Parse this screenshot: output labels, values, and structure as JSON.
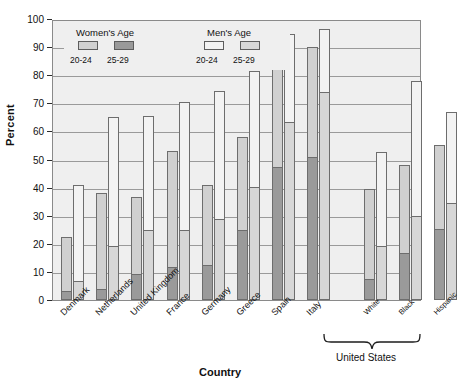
{
  "chart_data": {
    "type": "bar",
    "subtype": "grouped-stacked-bar",
    "title": "",
    "xlabel": "Country",
    "ylabel": "Percent",
    "ylim": [
      0,
      100
    ],
    "yticks": [
      0,
      10,
      20,
      30,
      40,
      50,
      60,
      70,
      80,
      90,
      100
    ],
    "grid": true,
    "legend_position": "top-left-inside",
    "categories": [
      "Denmark",
      "Netherlands",
      "United Kingdom",
      "France",
      "Germany",
      "Greece",
      "Spain",
      "Italy",
      "White",
      "Black",
      "Hispanic"
    ],
    "group_annotation": {
      "label": "United States",
      "covers": [
        "White",
        "Black",
        "Hispanic"
      ]
    },
    "series": [
      {
        "name": "Women's Age 20-24",
        "legend_group": "Women's Age",
        "age": "20-24",
        "color": "#d0d0d0",
        "values": [
          22.5,
          38.0,
          36.5,
          53.0,
          41.0,
          58.0,
          87.0,
          90.0,
          39.5,
          48.0,
          55.0
        ]
      },
      {
        "name": "Women's Age 25-29",
        "legend_group": "Women's Age",
        "age": "25-29",
        "color": "#9a9a9a",
        "values": [
          3.0,
          3.5,
          9.0,
          11.5,
          12.0,
          24.5,
          47.0,
          50.5,
          7.0,
          16.5,
          25.0
        ]
      },
      {
        "name": "Men's Age 20-24",
        "legend_group": "Men's Age",
        "age": "20-24",
        "color": "#f3f3f3",
        "values": [
          41.0,
          65.0,
          65.5,
          70.5,
          74.5,
          81.5,
          94.5,
          96.5,
          52.5,
          78.0,
          67.0
        ]
      },
      {
        "name": "Men's Age 25-29",
        "legend_group": "Men's Age",
        "age": "25-29",
        "color": "#d7d7d7",
        "values": [
          6.5,
          19.0,
          24.5,
          24.5,
          28.5,
          40.0,
          63.0,
          73.5,
          19.0,
          29.5,
          34.0
        ]
      }
    ]
  },
  "legend": {
    "women_title": "Women's Age",
    "men_title": "Men's Age",
    "women_20_24": "20-24",
    "women_25_29": "25-29",
    "men_20_24": "20-24",
    "men_25_29": "25-29"
  },
  "axes": {
    "ylabel": "Percent",
    "xlabel": "Country",
    "yticks": [
      "100",
      "90",
      "80",
      "70",
      "60",
      "50",
      "40",
      "30",
      "20",
      "10",
      "0"
    ]
  },
  "xlabels": [
    "Denmark",
    "Netherlands",
    "United Kingdom",
    "France",
    "Germany",
    "Greece",
    "Spain",
    "Italy",
    "White",
    "Black",
    "Hispanic"
  ],
  "us_bracket_label": "United States",
  "colors": {
    "women_20_24": "#d0d0d0",
    "women_25_29": "#9a9a9a",
    "men_20_24": "#f3f3f3",
    "men_25_29": "#d7d7d7",
    "plot_background": "#efefef",
    "grid": "#9a9a9a",
    "outline": "#6d6d6d"
  }
}
